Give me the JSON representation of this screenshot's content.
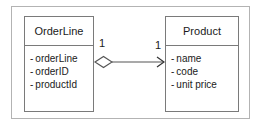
{
  "diagram": {
    "type": "uml-class-diagram",
    "frame": {
      "visible": true,
      "border_color": "#b3b3b3"
    },
    "background_color": "#ffffff",
    "line_color": "#555555",
    "box_border_color": "#7a7a7a",
    "text_color": "#1a1a1a",
    "classes": [
      {
        "id": "orderline",
        "name": "OrderLine",
        "attributes": [
          {
            "visibility": "-",
            "name": "orderLine"
          },
          {
            "visibility": "-",
            "name": "orderID"
          },
          {
            "visibility": "-",
            "name": "productId"
          }
        ]
      },
      {
        "id": "product",
        "name": "Product",
        "attributes": [
          {
            "visibility": "-",
            "name": "name"
          },
          {
            "visibility": "-",
            "name": "code"
          },
          {
            "visibility": "-",
            "name": "unit price"
          }
        ]
      }
    ],
    "relationship": {
      "kind": "aggregation",
      "source": "OrderLine",
      "target": "Product",
      "source_decoration": "hollow-diamond",
      "target_decoration": "open-arrowhead",
      "source_multiplicity": "1",
      "target_multiplicity": "1",
      "label": ""
    }
  }
}
